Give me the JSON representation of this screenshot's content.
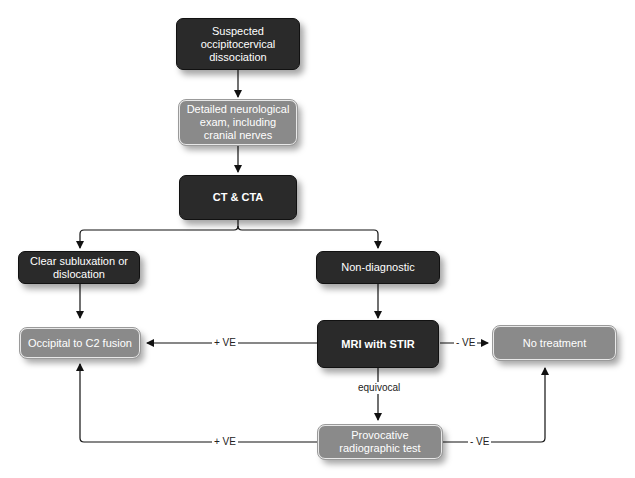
{
  "diagram": {
    "type": "flowchart",
    "nodes": {
      "suspected": "Suspected occipitocervical dissociation",
      "neuro_exam": "Detailed neurological exam, including cranial nerves",
      "ct_cta": "CT & CTA",
      "clear_sublux": "Clear subluxation or dislocation",
      "non_diag": "Non-diagnostic",
      "fusion": "Occipital to C2 fusion",
      "mri": "MRI with STIR",
      "no_treatment": "No treatment",
      "provocative": "Provocative radiographic test"
    },
    "edge_labels": {
      "mri_pos": "+ VE",
      "mri_neg": "- VE",
      "equivocal": "equivocal",
      "prov_pos": "+ VE",
      "prov_neg": "- VE"
    },
    "colors": {
      "dark_node": "#2a2a2a",
      "gray_node": "#8a8a8a",
      "line": "#111111"
    }
  }
}
